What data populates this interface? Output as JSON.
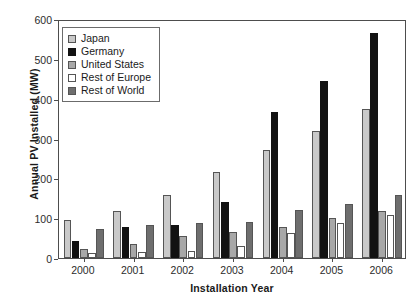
{
  "chart_data": {
    "type": "bar",
    "title": "",
    "xlabel": "Installation Year",
    "ylabel": "Annual PV Installed (MW)",
    "categories": [
      "2000",
      "2001",
      "2002",
      "2003",
      "2004",
      "2005",
      "2006"
    ],
    "ylim": [
      0,
      600
    ],
    "yticks": [
      0,
      100,
      200,
      300,
      400,
      500,
      600
    ],
    "ytick_labels": [
      "0",
      "100",
      "200",
      "300",
      "400",
      "500",
      "600"
    ],
    "grid": false,
    "legend_position": "upper left",
    "series": [
      {
        "name": "Japan",
        "color": "#c9c9c9",
        "values": [
          95,
          118,
          158,
          215,
          272,
          318,
          375
        ]
      },
      {
        "name": "Germany",
        "color": "#121212",
        "values": [
          42,
          78,
          82,
          140,
          366,
          445,
          565
        ]
      },
      {
        "name": "United States",
        "color": "#a8a8a8",
        "values": [
          22,
          36,
          55,
          65,
          78,
          100,
          118
        ]
      },
      {
        "name": "Rest of Europe",
        "color": "#ffffff",
        "values": [
          12,
          14,
          18,
          30,
          62,
          88,
          108
        ]
      },
      {
        "name": "Rest of World",
        "color": "#6e6e6e",
        "values": [
          72,
          82,
          88,
          90,
          120,
          135,
          157
        ]
      }
    ]
  }
}
